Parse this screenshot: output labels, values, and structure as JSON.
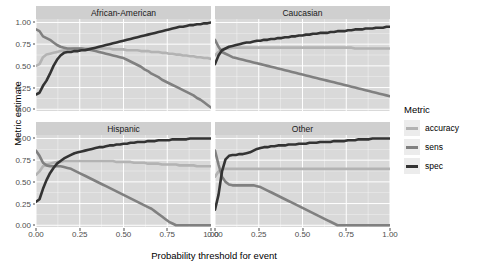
{
  "chart_data": {
    "type": "line",
    "title": "",
    "xlabel": "Probability threshold for event",
    "ylabel": "Metric estimate",
    "xlim": [
      0,
      1
    ],
    "ylim": [
      -0.02,
      1.04
    ],
    "xticks": [
      "0.00",
      "0.25",
      "0.50",
      "0.75",
      "1.00"
    ],
    "xtickvals": [
      0,
      0.25,
      0.5,
      0.75,
      1
    ],
    "yticks": [
      "0.00",
      "0.25",
      "0.50",
      "0.75",
      "1.00"
    ],
    "ytickvals": [
      0,
      0.25,
      0.5,
      0.75,
      1
    ],
    "grid": true,
    "grid_color": "#ffffff",
    "panel_background": "#d9d9d9",
    "strip_background": "#cfcfcf",
    "legend_position": "right",
    "legend_title": "Metric",
    "facet_variable": "race",
    "facets": [
      "African-American",
      "Caucasian",
      "Hispanic",
      "Other"
    ],
    "series_names": [
      "accuracy",
      "sens",
      "spec"
    ],
    "series_colors": [
      "#b3b3b3",
      "#808080",
      "#333333"
    ],
    "x": [
      0.0,
      0.02,
      0.04,
      0.06,
      0.08,
      0.1,
      0.12,
      0.14,
      0.16,
      0.18,
      0.2,
      0.22,
      0.24,
      0.26,
      0.28,
      0.3,
      0.32,
      0.34,
      0.36,
      0.38,
      0.4,
      0.42,
      0.44,
      0.46,
      0.48,
      0.5,
      0.52,
      0.54,
      0.56,
      0.58,
      0.6,
      0.62,
      0.64,
      0.66,
      0.68,
      0.7,
      0.72,
      0.74,
      0.76,
      0.78,
      0.8,
      0.82,
      0.84,
      0.86,
      0.88,
      0.9,
      0.92,
      0.94,
      0.96,
      0.98,
      1.0
    ],
    "panels": [
      {
        "facet": "African-American",
        "series": [
          {
            "name": "accuracy",
            "values": [
              0.5,
              0.52,
              0.6,
              0.63,
              0.64,
              0.65,
              0.66,
              0.67,
              0.68,
              0.69,
              0.69,
              0.7,
              0.7,
              0.7,
              0.7,
              0.7,
              0.7,
              0.7,
              0.7,
              0.7,
              0.7,
              0.7,
              0.69,
              0.69,
              0.69,
              0.69,
              0.68,
              0.68,
              0.68,
              0.68,
              0.67,
              0.67,
              0.67,
              0.66,
              0.66,
              0.66,
              0.65,
              0.65,
              0.64,
              0.64,
              0.63,
              0.63,
              0.62,
              0.62,
              0.61,
              0.61,
              0.6,
              0.6,
              0.59,
              0.59,
              0.58
            ]
          },
          {
            "name": "sens",
            "values": [
              0.92,
              0.9,
              0.84,
              0.82,
              0.8,
              0.77,
              0.74,
              0.72,
              0.71,
              0.7,
              0.7,
              0.7,
              0.7,
              0.7,
              0.69,
              0.69,
              0.68,
              0.67,
              0.66,
              0.65,
              0.64,
              0.63,
              0.62,
              0.61,
              0.6,
              0.59,
              0.57,
              0.55,
              0.53,
              0.51,
              0.49,
              0.46,
              0.44,
              0.41,
              0.39,
              0.37,
              0.34,
              0.32,
              0.3,
              0.28,
              0.26,
              0.24,
              0.22,
              0.2,
              0.18,
              0.16,
              0.13,
              0.11,
              0.08,
              0.05,
              0.02
            ]
          },
          {
            "name": "spec",
            "values": [
              0.17,
              0.19,
              0.27,
              0.33,
              0.41,
              0.5,
              0.57,
              0.62,
              0.65,
              0.66,
              0.66,
              0.67,
              0.67,
              0.68,
              0.68,
              0.69,
              0.7,
              0.71,
              0.72,
              0.73,
              0.74,
              0.75,
              0.76,
              0.77,
              0.78,
              0.79,
              0.8,
              0.81,
              0.82,
              0.83,
              0.84,
              0.85,
              0.86,
              0.87,
              0.88,
              0.89,
              0.9,
              0.91,
              0.92,
              0.93,
              0.94,
              0.95,
              0.95,
              0.96,
              0.97,
              0.97,
              0.98,
              0.98,
              0.99,
              0.99,
              1.0
            ]
          }
        ]
      },
      {
        "facet": "Caucasian",
        "series": [
          {
            "name": "accuracy",
            "values": [
              0.62,
              0.66,
              0.69,
              0.7,
              0.7,
              0.71,
              0.71,
              0.71,
              0.71,
              0.71,
              0.71,
              0.71,
              0.71,
              0.71,
              0.71,
              0.71,
              0.71,
              0.71,
              0.71,
              0.71,
              0.71,
              0.71,
              0.71,
              0.71,
              0.71,
              0.71,
              0.71,
              0.71,
              0.71,
              0.71,
              0.71,
              0.71,
              0.71,
              0.71,
              0.71,
              0.71,
              0.71,
              0.71,
              0.71,
              0.71,
              0.7,
              0.7,
              0.7,
              0.7,
              0.7,
              0.7,
              0.7,
              0.7,
              0.7,
              0.7,
              0.7
            ]
          },
          {
            "name": "sens",
            "values": [
              0.8,
              0.72,
              0.66,
              0.64,
              0.62,
              0.6,
              0.59,
              0.58,
              0.57,
              0.56,
              0.55,
              0.54,
              0.53,
              0.52,
              0.51,
              0.5,
              0.49,
              0.48,
              0.47,
              0.46,
              0.45,
              0.44,
              0.43,
              0.42,
              0.41,
              0.4,
              0.39,
              0.38,
              0.37,
              0.36,
              0.35,
              0.34,
              0.33,
              0.32,
              0.31,
              0.3,
              0.29,
              0.28,
              0.27,
              0.26,
              0.25,
              0.24,
              0.23,
              0.22,
              0.21,
              0.2,
              0.19,
              0.18,
              0.17,
              0.16,
              0.15
            ]
          },
          {
            "name": "spec",
            "values": [
              0.52,
              0.62,
              0.68,
              0.7,
              0.72,
              0.73,
              0.74,
              0.75,
              0.76,
              0.77,
              0.77,
              0.78,
              0.79,
              0.79,
              0.8,
              0.8,
              0.81,
              0.81,
              0.82,
              0.82,
              0.83,
              0.83,
              0.84,
              0.84,
              0.85,
              0.85,
              0.86,
              0.86,
              0.87,
              0.87,
              0.88,
              0.88,
              0.88,
              0.89,
              0.89,
              0.9,
              0.9,
              0.9,
              0.91,
              0.91,
              0.92,
              0.92,
              0.92,
              0.93,
              0.93,
              0.93,
              0.94,
              0.94,
              0.94,
              0.95,
              0.95
            ]
          }
        ]
      },
      {
        "facet": "Hispanic",
        "values_note": "",
        "series": [
          {
            "name": "accuracy",
            "values": [
              0.58,
              0.62,
              0.68,
              0.7,
              0.71,
              0.72,
              0.73,
              0.73,
              0.74,
              0.74,
              0.74,
              0.74,
              0.74,
              0.74,
              0.74,
              0.74,
              0.74,
              0.74,
              0.74,
              0.74,
              0.74,
              0.74,
              0.74,
              0.73,
              0.73,
              0.73,
              0.73,
              0.73,
              0.72,
              0.72,
              0.72,
              0.72,
              0.71,
              0.71,
              0.71,
              0.71,
              0.7,
              0.7,
              0.7,
              0.7,
              0.7,
              0.69,
              0.69,
              0.69,
              0.69,
              0.69,
              0.68,
              0.68,
              0.68,
              0.68,
              0.68
            ]
          },
          {
            "name": "sens",
            "values": [
              0.86,
              0.8,
              0.72,
              0.69,
              0.68,
              0.68,
              0.68,
              0.68,
              0.67,
              0.66,
              0.65,
              0.63,
              0.61,
              0.59,
              0.57,
              0.55,
              0.53,
              0.51,
              0.49,
              0.47,
              0.45,
              0.43,
              0.41,
              0.39,
              0.37,
              0.35,
              0.33,
              0.31,
              0.29,
              0.27,
              0.25,
              0.23,
              0.21,
              0.19,
              0.16,
              0.13,
              0.1,
              0.07,
              0.04,
              0.02,
              0.0,
              0.0,
              0.0,
              0.0,
              0.0,
              0.0,
              0.0,
              0.0,
              0.0,
              0.0,
              0.0
            ]
          },
          {
            "name": "spec",
            "values": [
              0.27,
              0.3,
              0.42,
              0.52,
              0.6,
              0.66,
              0.71,
              0.74,
              0.77,
              0.79,
              0.81,
              0.83,
              0.84,
              0.85,
              0.86,
              0.87,
              0.88,
              0.89,
              0.9,
              0.9,
              0.91,
              0.92,
              0.92,
              0.93,
              0.93,
              0.94,
              0.94,
              0.95,
              0.95,
              0.96,
              0.96,
              0.96,
              0.97,
              0.97,
              0.97,
              0.98,
              0.98,
              0.98,
              0.98,
              0.99,
              0.99,
              0.99,
              0.99,
              0.99,
              1.0,
              1.0,
              1.0,
              1.0,
              1.0,
              1.0,
              1.0
            ]
          }
        ]
      },
      {
        "facet": "Other",
        "series": [
          {
            "name": "accuracy",
            "values": [
              0.56,
              0.62,
              0.65,
              0.65,
              0.65,
              0.65,
              0.65,
              0.65,
              0.65,
              0.65,
              0.65,
              0.65,
              0.65,
              0.65,
              0.65,
              0.65,
              0.65,
              0.65,
              0.65,
              0.65,
              0.65,
              0.65,
              0.65,
              0.65,
              0.65,
              0.65,
              0.65,
              0.65,
              0.65,
              0.65,
              0.65,
              0.65,
              0.65,
              0.65,
              0.65,
              0.65,
              0.65,
              0.65,
              0.65,
              0.65,
              0.65,
              0.65,
              0.65,
              0.65,
              0.65,
              0.65,
              0.65,
              0.65,
              0.65,
              0.65,
              0.65
            ]
          },
          {
            "name": "sens",
            "values": [
              0.86,
              0.7,
              0.56,
              0.5,
              0.47,
              0.46,
              0.46,
              0.46,
              0.46,
              0.46,
              0.46,
              0.46,
              0.45,
              0.44,
              0.42,
              0.4,
              0.38,
              0.36,
              0.34,
              0.32,
              0.3,
              0.28,
              0.26,
              0.24,
              0.22,
              0.2,
              0.18,
              0.16,
              0.14,
              0.12,
              0.1,
              0.08,
              0.06,
              0.04,
              0.02,
              0.0,
              0.0,
              0.0,
              0.0,
              0.0,
              0.0,
              0.0,
              0.0,
              0.0,
              0.0,
              0.0,
              0.0,
              0.0,
              0.0,
              0.0,
              0.0
            ]
          },
          {
            "name": "spec",
            "values": [
              0.18,
              0.35,
              0.62,
              0.76,
              0.8,
              0.81,
              0.81,
              0.82,
              0.82,
              0.83,
              0.84,
              0.86,
              0.88,
              0.89,
              0.9,
              0.9,
              0.91,
              0.91,
              0.92,
              0.92,
              0.92,
              0.93,
              0.93,
              0.93,
              0.94,
              0.94,
              0.94,
              0.95,
              0.95,
              0.95,
              0.96,
              0.96,
              0.96,
              0.96,
              0.97,
              0.97,
              0.97,
              0.97,
              0.98,
              0.98,
              0.98,
              0.99,
              0.99,
              0.99,
              0.99,
              1.0,
              1.0,
              1.0,
              1.0,
              1.0,
              1.0
            ]
          }
        ]
      }
    ]
  },
  "legend": {
    "title": "Metric",
    "items": [
      {
        "label": "accuracy",
        "color": "#b3b3b3"
      },
      {
        "label": "sens",
        "color": "#808080"
      },
      {
        "label": "spec",
        "color": "#333333"
      }
    ]
  }
}
